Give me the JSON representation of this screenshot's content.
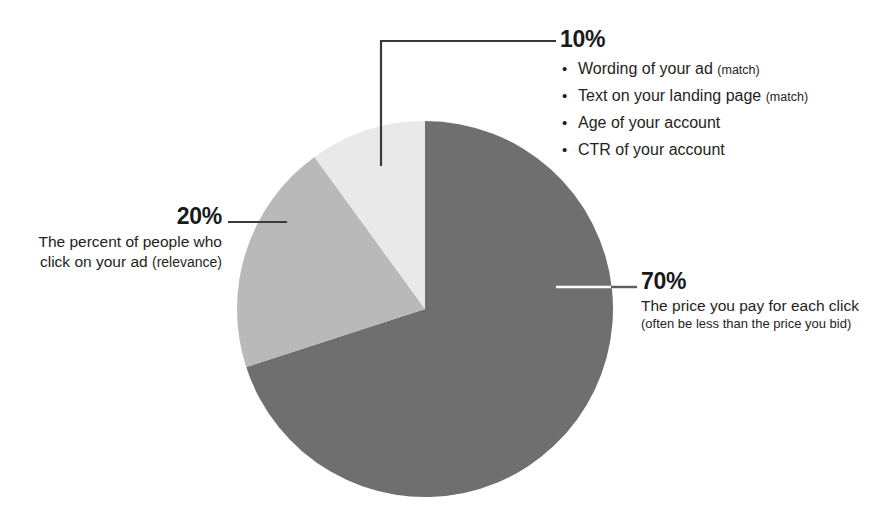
{
  "chart_data": {
    "type": "pie",
    "title": "",
    "subtitle": "",
    "xlabel": "",
    "ylabel": "",
    "legend_position": "callout-labels",
    "grid": false,
    "start_angle_deg": 0,
    "direction": "clockwise",
    "center": {
      "x": 425,
      "y": 309,
      "r": 188
    },
    "categories": [
      "The price you pay for each click",
      "The percent of people who click on your ad (relevance)",
      "Wording of your ad (match); Text on your landing page (match); Age of your account; CTR of your account"
    ],
    "values": [
      70,
      20,
      10
    ],
    "slices": [
      {
        "id": "slice-70",
        "label": "70%",
        "value": 70,
        "color": "#6f6f6f",
        "start_deg": 0,
        "end_deg": 252
      },
      {
        "id": "slice-20",
        "label": "20%",
        "value": 20,
        "color": "#b9b9b9",
        "start_deg": 252,
        "end_deg": 324
      },
      {
        "id": "slice-10",
        "label": "10%",
        "value": 10,
        "color": "#e9e9e9",
        "start_deg": 324,
        "end_deg": 360
      }
    ]
  },
  "colors": {
    "slice_dark": "#6f6f6f",
    "slice_medium": "#b9b9b9",
    "slice_light": "#e9e9e9",
    "leader_dark": "#3a3a3a",
    "leader_light": "#ffffff",
    "text": "#231f20",
    "background": "#ffffff"
  },
  "callouts": {
    "ten": {
      "percent": "10%",
      "bullets": [
        {
          "text": "Wording of your ad ",
          "note": "(match)"
        },
        {
          "text": "Text on your landing page ",
          "note": "(match)"
        },
        {
          "text": "Age of your account",
          "note": ""
        },
        {
          "text": "CTR of your account",
          "note": ""
        }
      ]
    },
    "seventy": {
      "percent": "70%",
      "line1": "The price you pay for each click",
      "line2": "(often be less than the price you bid)"
    },
    "twenty": {
      "percent": "20%",
      "line1": "The percent of people who",
      "line2": "click on your ad ",
      "line2_note": "(relevance)"
    }
  }
}
